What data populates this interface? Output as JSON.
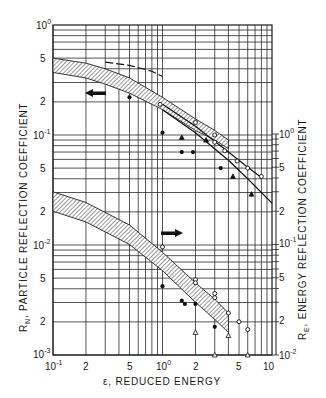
{
  "chart_data": {
    "type": "scatter",
    "title": "",
    "xlabel": "ε, REDUCED ENERGY",
    "ylabel_left": "R_N, PARTICLE REFLECTION COEFFICIENT",
    "ylabel_right": "R_E, ENERGY REFLECTION COEFFICIENT",
    "xscale": "log",
    "yscale": "log",
    "xlim": [
      0.1,
      10
    ],
    "ylim_left": [
      0.001,
      1
    ],
    "ylim_right": [
      0.01,
      1
    ],
    "grid": true,
    "x_ticks": [
      "10^-1",
      "2",
      "5",
      "10^0",
      "2",
      "5",
      "10"
    ],
    "y_ticks_left": [
      "10^0",
      "5",
      "2",
      "10^-1",
      "5",
      "2",
      "10^-2",
      "5",
      "2",
      "10^-3"
    ],
    "y_ticks_right": [
      "10^0",
      "5",
      "2",
      "10^-1",
      "5",
      "2",
      "10^-2"
    ],
    "annotations": [
      {
        "type": "arrow",
        "direction": "left",
        "meaning": "upper band refers to left axis (R_N)",
        "x": 0.22,
        "y": 0.23
      },
      {
        "type": "arrow",
        "direction": "right",
        "meaning": "lower band refers to right axis (R_E)",
        "x": 1.4,
        "y": 0.09
      }
    ],
    "bands": [
      {
        "name": "R_N band (particle reflection)",
        "axis": "left",
        "x": [
          0.1,
          0.2,
          0.3,
          0.5,
          1.0,
          2.0,
          3.0,
          4.0
        ],
        "upper": [
          0.5,
          0.45,
          0.4,
          0.33,
          0.22,
          0.14,
          0.11,
          0.09
        ],
        "lower": [
          0.37,
          0.33,
          0.29,
          0.24,
          0.17,
          0.11,
          0.09,
          0.075
        ]
      },
      {
        "name": "R_E band (energy reflection)",
        "axis": "right",
        "x": [
          0.1,
          0.2,
          0.5,
          1.0,
          2.0,
          3.0,
          4.0
        ],
        "upper": [
          0.3,
          0.24,
          0.15,
          0.085,
          0.045,
          0.032,
          0.024
        ],
        "lower": [
          0.2,
          0.16,
          0.1,
          0.058,
          0.03,
          0.021,
          0.016
        ]
      }
    ],
    "series": [
      {
        "name": "theory curve upper (R_N)",
        "type": "line",
        "axis": "left",
        "x": [
          1.0,
          2.0,
          4.0,
          6.0,
          8.0
        ],
        "values": [
          0.19,
          0.12,
          0.07,
          0.051,
          0.041
        ]
      },
      {
        "name": "theory curve lower (R_N)",
        "type": "line",
        "axis": "left",
        "x": [
          1.0,
          2.0,
          4.0,
          6.0,
          10.0
        ],
        "values": [
          0.17,
          0.105,
          0.059,
          0.04,
          0.024
        ]
      },
      {
        "name": "dashed curve top (R_N)",
        "type": "line",
        "axis": "left",
        "x": [
          0.3,
          0.5,
          0.8,
          1.0
        ],
        "values": [
          0.46,
          0.43,
          0.38,
          0.34
        ]
      },
      {
        "name": "open circles (R_N)",
        "marker": "circle-open",
        "axis": "left",
        "x": [
          0.95,
          2.0,
          3.0,
          3.0,
          3.7,
          4.8,
          6.0,
          8.0
        ],
        "values": [
          0.19,
          0.13,
          0.1,
          0.086,
          0.072,
          0.058,
          0.05,
          0.042
        ]
      },
      {
        "name": "filled circles (R_N)",
        "marker": "circle-filled",
        "axis": "left",
        "x": [
          0.5,
          1.0,
          1.5,
          1.9,
          3.4
        ],
        "values": [
          0.22,
          0.105,
          0.07,
          0.07,
          0.05
        ]
      },
      {
        "name": "filled triangles (R_N)",
        "marker": "triangle-filled",
        "axis": "left",
        "x": [
          1.5,
          2.5,
          4.4,
          6.5
        ],
        "values": [
          0.095,
          0.09,
          0.042,
          0.029
        ]
      },
      {
        "name": "open circles (R_E)",
        "marker": "circle-open",
        "axis": "right",
        "x": [
          1.0,
          2.0,
          2.0,
          3.0,
          3.0,
          4.0,
          5.0,
          6.0
        ],
        "values": [
          0.095,
          0.048,
          0.045,
          0.036,
          0.033,
          0.024,
          0.02,
          0.017
        ]
      },
      {
        "name": "filled circles (R_E)",
        "marker": "circle-filled",
        "axis": "right",
        "x": [
          1.0,
          1.5,
          1.6,
          2.0,
          3.0
        ],
        "values": [
          0.042,
          0.031,
          0.029,
          0.029,
          0.018
        ]
      },
      {
        "name": "triangles (R_E)",
        "marker": "triangle",
        "axis": "right",
        "x": [
          2.0,
          3.0,
          4.0,
          6.0
        ],
        "values": [
          0.016,
          0.01,
          0.015,
          0.01
        ]
      }
    ]
  },
  "labels": {
    "x_title": "ε, REDUCED ENERGY",
    "y_left_title": "R",
    "y_left_sub": "N",
    "y_left_rest": ", PARTICLE   REFLECTION   COEFFICIENT",
    "y_right_title": "R",
    "y_right_sub": "E",
    "y_right_rest": ", ENERGY   REFLECTION   COEFFICIENT",
    "x_ticks": {
      "t0_base": "10",
      "t0_exp": "-1",
      "t1": "2",
      "t2": "5",
      "t3_base": "10",
      "t3_exp": "0",
      "t4": "2",
      "t5": "5",
      "t6": "10"
    },
    "yl_ticks": {
      "e0_base": "10",
      "e0_exp": "0",
      "a5": "5",
      "a2": "2",
      "e1_base": "10",
      "e1_exp": "-1",
      "b5": "5",
      "b2": "2",
      "e2_base": "10",
      "e2_exp": "-2",
      "c5": "5",
      "c2": "2",
      "e3_base": "10",
      "e3_exp": "-3"
    },
    "yr_ticks": {
      "e0_base": "10",
      "e0_exp": "0",
      "a5": "5",
      "a2": "2",
      "e1_base": "10",
      "e1_exp": "-1",
      "b5": "5",
      "b2": "2",
      "e2_base": "10",
      "e2_exp": "-2"
    }
  }
}
